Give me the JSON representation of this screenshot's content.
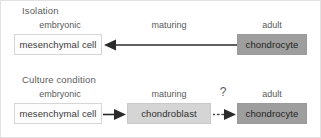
{
  "diagram": {
    "title_hidden": "",
    "stages": {
      "embryonic": "embryonic",
      "maturing": "maturing",
      "adult": "adult"
    },
    "panels": [
      {
        "id": "isolation",
        "title": "Isolation",
        "stage_labels": [
          "embryonic",
          "maturing",
          "adult"
        ],
        "nodes": [
          {
            "id": "mesenchymal-cell",
            "label": "mesenchymal cell",
            "fill": "#fdfdfd",
            "stage": "embryonic"
          },
          {
            "id": "chondrocyte",
            "label": "chondrocyte",
            "fill": "#9e9e9e",
            "stage": "adult"
          }
        ],
        "edges": [
          {
            "id": "chondrocyte-to-mesenchymal",
            "from": "chondrocyte",
            "to": "mesenchymal-cell",
            "style": "solid",
            "direction": "left",
            "label": ""
          }
        ]
      },
      {
        "id": "culture-condition",
        "title": "Culture condition",
        "stage_labels": [
          "embryonic",
          "maturing",
          "adult"
        ],
        "nodes": [
          {
            "id": "mesenchymal-cell",
            "label": "mesenchymal cell",
            "fill": "#fdfdfd",
            "stage": "embryonic"
          },
          {
            "id": "chondroblast",
            "label": "chondroblast",
            "fill": "#d5d5d5",
            "stage": "maturing"
          },
          {
            "id": "chondrocyte",
            "label": "chondrocyte",
            "fill": "#9e9e9e",
            "stage": "adult"
          }
        ],
        "edges": [
          {
            "id": "mesenchymal-to-chondroblast",
            "from": "mesenchymal-cell",
            "to": "chondroblast",
            "style": "solid",
            "direction": "right",
            "label": ""
          },
          {
            "id": "chondroblast-to-chondrocyte",
            "from": "chondroblast",
            "to": "chondrocyte",
            "style": "dotted",
            "direction": "right",
            "label": "?"
          }
        ]
      }
    ],
    "uncertainty_marker": "?",
    "colors": {
      "background": "#ffffff",
      "border": "#e2e2e2",
      "text": "#3a3a3a",
      "label_text": "#5a5a5a",
      "arrow": "#2b2b2b",
      "node_light": "#fdfdfd",
      "node_mid": "#d5d5d5",
      "node_dark": "#9e9e9e"
    }
  }
}
